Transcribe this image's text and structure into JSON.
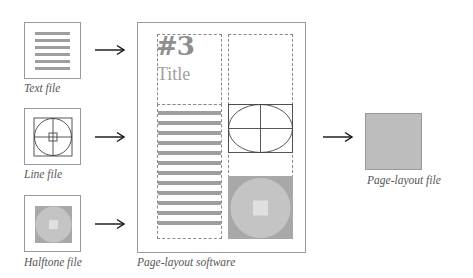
{
  "diagram": {
    "type": "workflow",
    "inputs": [
      {
        "id": "text",
        "label": "Text file",
        "content": "text-lines"
      },
      {
        "id": "line",
        "label": "Line file",
        "content": "line-art"
      },
      {
        "id": "halftone",
        "label": "Halftone file",
        "content": "halftone-image"
      }
    ],
    "process": {
      "label": "Page-layout software",
      "page": {
        "heading_number": "#3",
        "heading_title": "Title"
      }
    },
    "output": {
      "label": "Page-layout file"
    },
    "arrows": [
      "text-to-layout",
      "line-to-layout",
      "halftone-to-layout",
      "layout-to-output"
    ],
    "colors": {
      "stripe": "#9e9e9e",
      "halftone_bg": "#a8a8a8",
      "halftone_circle": "#c4c4c4",
      "halftone_center": "#e0e0e0",
      "output_fill": "#bdbdbd",
      "heading_text": "#8e8e8e",
      "border": "#9a9a9a"
    }
  }
}
